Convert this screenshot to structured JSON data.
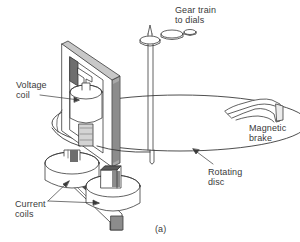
{
  "figure": {
    "caption": "(a)",
    "colors": {
      "line": "#3a3a3a",
      "shade_dark": "#6e6e6e",
      "shade_mid": "#a8a8a8",
      "shade_light": "#d4d4d4",
      "background": "#ffffff"
    }
  },
  "labels": {
    "gear_train": "Gear train\nto dials",
    "voltage_coil": "Voltage\ncoil",
    "magnetic_brake": "Magnetic\nbrake",
    "rotating_disc": "Rotating\ndisc",
    "current_coils": "Current\ncoils"
  }
}
